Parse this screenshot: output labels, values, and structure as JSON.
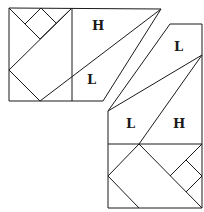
{
  "figure": {
    "labels": {
      "top_h": "H",
      "top_l": "L",
      "right_l": "L",
      "bottom_l": "L",
      "bottom_h": "H"
    },
    "colors": {
      "stroke": "#1a1a1a",
      "background": "#ffffff"
    }
  }
}
